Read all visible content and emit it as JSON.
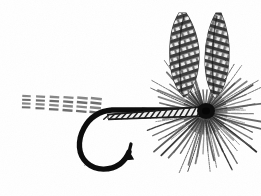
{
  "image": {
    "subject": "artificial dry fly fishing lure",
    "style": "grayscale halftone line engraving",
    "background_color": "#ffffff",
    "ink_color": "#1a1a1a",
    "mid_gray": "#6e6e6e",
    "light_gray": "#a8a8a8",
    "width": 261,
    "height": 196,
    "orientation": "hook point down, tail to the left, head and wings to the right"
  },
  "parts": {
    "tail": {
      "name": "barred tail fibers",
      "color": "#5a5a5a",
      "segment_count": 6,
      "x_start": 22,
      "x_end": 104,
      "y": 104,
      "bar_rows": 4,
      "description": "six short speckled barred clumps trailing left from the hook bend"
    },
    "hook": {
      "name": "hook shank bend and point",
      "color": "#111111",
      "shank_y": 110,
      "bend_bottom_y": 168,
      "point_x": 128,
      "barb": true,
      "description": "heavy black curved hook with upturned point and barb facing right"
    },
    "body": {
      "name": "ribbed quill body",
      "color": "#3a3a3a",
      "x_start": 106,
      "x_end": 205,
      "y": 110,
      "rib_count": 17,
      "description": "tapered body wrapped with diagonal rib segments"
    },
    "hackle": {
      "name": "radial hackle collar",
      "color": "#4a4a4a",
      "center_x": 205,
      "center_y": 112,
      "radius_min": 38,
      "radius_max": 66,
      "fiber_count": 86,
      "description": "dense starburst of hackle fibers radiating around the head"
    },
    "head": {
      "name": "thread head knot",
      "color": "#0c0c0c",
      "center_x": 206,
      "center_y": 111,
      "radius": 9
    },
    "wings": {
      "name": "upright barred wings",
      "color": "#4f4f4f",
      "count": 2,
      "left_wing": {
        "tip_x": 178,
        "tip_y": 14,
        "base_x": 196,
        "base_y": 96,
        "bar_count": 11,
        "lean_degrees": -10
      },
      "right_wing": {
        "tip_x": 219,
        "tip_y": 14,
        "base_x": 208,
        "base_y": 96,
        "bar_count": 11,
        "lean_degrees": 7
      },
      "description": "two slender mottled barred feather slips standing upright in a V"
    }
  },
  "alt_text": "Black and white halftone illustration of an artificial dry fly: a barred tail, black curved hook, ribbed body, dense radial hackle, and two upright barred wings."
}
